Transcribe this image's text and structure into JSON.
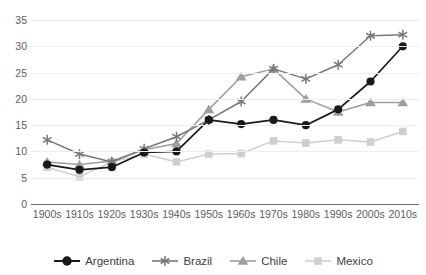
{
  "chart_data": {
    "type": "line",
    "title": "",
    "xlabel": "",
    "ylabel": "",
    "categories": [
      "1900s",
      "1910s",
      "1920s",
      "1930s",
      "1940s",
      "1950s",
      "1960s",
      "1970s",
      "1980s",
      "1990s",
      "2000s",
      "2010s"
    ],
    "ylim": [
      0,
      35
    ],
    "yticks": [
      0,
      5,
      10,
      15,
      20,
      25,
      30,
      35
    ],
    "grid": true,
    "legend_position": "bottom",
    "series": [
      {
        "name": "Argentina",
        "marker": "circle",
        "color": "#1a1a1a",
        "values": [
          7.5,
          6.5,
          7.0,
          9.8,
          10.0,
          16.0,
          15.2,
          16.0,
          15.0,
          18.0,
          23.3,
          30.0
        ]
      },
      {
        "name": "Brazil",
        "marker": "asterisk",
        "color": "#787878",
        "values": [
          12.2,
          9.5,
          8.0,
          10.5,
          12.8,
          16.0,
          19.5,
          25.7,
          23.8,
          26.5,
          32.0,
          32.2
        ]
      },
      {
        "name": "Chile",
        "marker": "triangle",
        "color": "#9e9e9e",
        "values": [
          8.0,
          7.5,
          8.2,
          10.3,
          11.5,
          18.0,
          24.2,
          25.7,
          20.0,
          17.5,
          19.3,
          19.3
        ]
      },
      {
        "name": "Mexico",
        "marker": "square",
        "color": "#cfcfcf",
        "values": [
          7.0,
          5.2,
          8.0,
          9.5,
          8.0,
          9.5,
          9.6,
          12.0,
          11.6,
          12.2,
          11.8,
          13.8
        ]
      }
    ]
  },
  "legend": {
    "items": [
      {
        "label": "Argentina"
      },
      {
        "label": "Brazil"
      },
      {
        "label": "Chile"
      },
      {
        "label": "Mexico"
      }
    ]
  },
  "axis": {
    "y_tick_labels": [
      "35",
      "30",
      "25",
      "20",
      "15",
      "10",
      "5",
      "0"
    ],
    "x_tick_labels": [
      "1900s",
      "1910s",
      "1920s",
      "1930s",
      "1940s",
      "1950s",
      "1960s",
      "1970s",
      "1980s",
      "1990s",
      "2000s",
      "2010s"
    ]
  }
}
